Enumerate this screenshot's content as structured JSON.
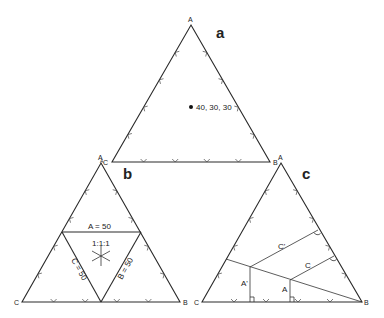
{
  "panels": [
    {
      "id": "a",
      "label": "a",
      "vertices": {
        "top": "A",
        "left": "C",
        "right": "B"
      },
      "point_label": "40, 30, 30",
      "corner_extra_left": "A"
    },
    {
      "id": "b",
      "label": "b",
      "vertices": {
        "top": "A",
        "left": "C",
        "right": "B"
      },
      "lines": {
        "a50": "A = 50",
        "b50": "B = 50",
        "c50": "C = 50"
      },
      "center_label": "1:1:1"
    },
    {
      "id": "c",
      "label": "c",
      "vertices": {
        "top": "A",
        "left": "C",
        "right": "B"
      },
      "segments": {
        "a_prime": "A'",
        "a": "A",
        "c_prime": "C'",
        "c": "C"
      }
    }
  ],
  "colors": {
    "line": "#2a2a2a",
    "background": "#ffffff"
  }
}
